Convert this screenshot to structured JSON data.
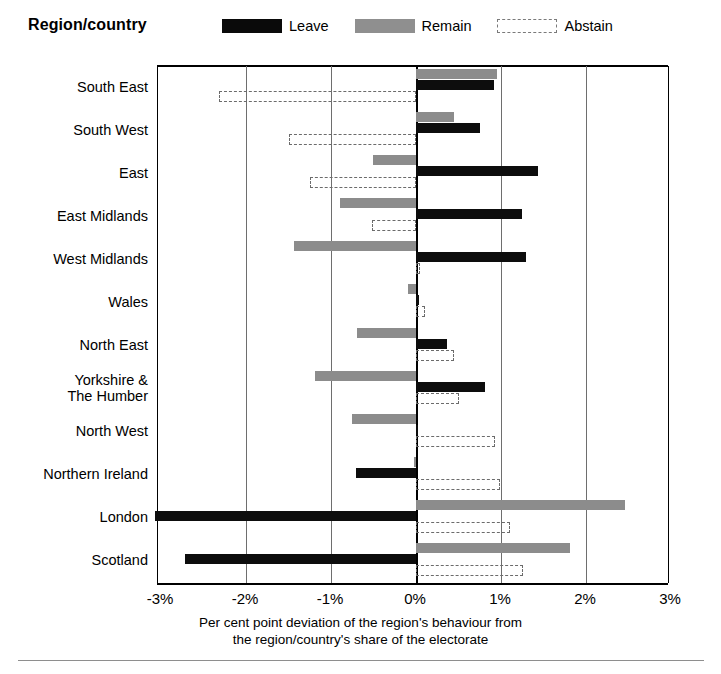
{
  "header": {
    "title": "Region/country"
  },
  "legend": {
    "position": "top",
    "items": [
      {
        "label": "Leave",
        "color": "#0d0d0d",
        "style": "solid",
        "icon": "legend-swatch-leave"
      },
      {
        "label": "Remain",
        "color": "#8c8c8c",
        "style": "solid",
        "icon": "legend-swatch-remain"
      },
      {
        "label": "Abstain",
        "color": "#ffffff",
        "style": "dashed",
        "icon": "legend-swatch-abstain"
      }
    ]
  },
  "axis": {
    "xticks": [
      "-3%",
      "-2%",
      "-1%",
      "0%",
      "1%",
      "2%",
      "3%"
    ],
    "xcaption_line1": "Per cent point deviation of the region's behaviour from",
    "xcaption_line2": "the region/country's share of the electorate"
  },
  "chart_data": {
    "type": "bar",
    "orientation": "horizontal",
    "title": "Region/country",
    "xlabel": "Per cent point deviation of the region's behaviour from the region/country's share of the electorate",
    "ylabel": "Region/country",
    "xlim": [
      -3,
      3
    ],
    "xticks": [
      -3,
      -2,
      -1,
      0,
      1,
      2,
      3
    ],
    "grid": true,
    "legend_position": "top",
    "categories": [
      "South East",
      "South West",
      "East",
      "East Midlands",
      "West Midlands",
      "Wales",
      "North East",
      "Yorkshire & The Humber",
      "North West",
      "Northern Ireland",
      "London",
      "Scotland"
    ],
    "series": [
      {
        "name": "Leave",
        "color": "#0d0d0d",
        "values": [
          0.92,
          0.75,
          1.43,
          1.25,
          1.29,
          0.04,
          0.36,
          0.81,
          0.02,
          -0.71,
          -3.07,
          -2.72
        ]
      },
      {
        "name": "Remain",
        "color": "#8c8c8c",
        "values": [
          0.95,
          0.45,
          -0.51,
          -0.89,
          -1.43,
          -0.1,
          -0.69,
          -1.19,
          -0.75,
          -0.02,
          2.46,
          1.81
        ]
      },
      {
        "name": "Abstain",
        "color": "#ffffff",
        "values": [
          -2.32,
          -1.49,
          -1.25,
          -0.52,
          0.05,
          0.1,
          0.45,
          0.51,
          0.93,
          0.99,
          1.11,
          1.26
        ]
      }
    ]
  }
}
